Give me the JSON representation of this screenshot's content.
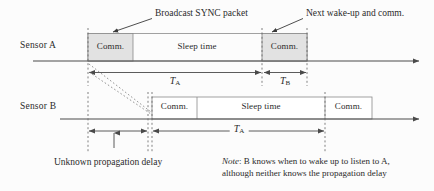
{
  "figure": {
    "colors": {
      "line": "#4a4a4a",
      "dashed": "#6a6a6a",
      "box_border": "#8a8a8a",
      "comm_fill_a": "#e2e2e2",
      "comm_fill_b": "#ffffff",
      "text": "#2b2b2b",
      "background": "#fcfcfc"
    }
  },
  "rows": {
    "sensor_a": {
      "label": "Sensor A",
      "segments": [
        {
          "label": "Comm.",
          "kind": "comm"
        },
        {
          "label": "Sleep time",
          "kind": "sleep"
        },
        {
          "label": "Comm.",
          "kind": "comm"
        }
      ]
    },
    "sensor_b": {
      "label": "Sensor B",
      "segments": [
        {
          "label": "Comm.",
          "kind": "comm"
        },
        {
          "label": "Sleep time",
          "kind": "sleep"
        },
        {
          "label": "Comm.",
          "kind": "comm"
        }
      ]
    }
  },
  "callouts": {
    "broadcast": "Broadcast SYNC packet",
    "next_wakeup": "Next wake-up and comm."
  },
  "measures": {
    "ta_a": {
      "symbol": "T",
      "subscript": "A"
    },
    "tb_a": {
      "symbol": "T",
      "subscript": "B"
    },
    "ta_b": {
      "symbol": "T",
      "subscript": "A"
    }
  },
  "captions": {
    "propagation_delay": "Unknown propagation delay",
    "note_prefix": "Note",
    "note_line1": ": B knows when to wake up to listen to A,",
    "note_line2": "although neither knows the propagation delay"
  }
}
